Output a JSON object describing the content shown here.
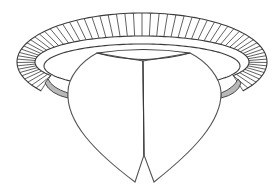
{
  "figure": {
    "width": 280,
    "height": 193,
    "colors": {
      "background": "#ffffff",
      "line": "#3a3a3a",
      "petal_line": "#555555",
      "shade": "#b8b8b8"
    },
    "collar": {
      "center_x": 142,
      "outer": {
        "cy": 62,
        "rx": 125,
        "ry": 49
      },
      "rib_band_inner": {
        "cy": 62,
        "rx": 107,
        "ry": 26
      },
      "band_inner": {
        "cy": 66,
        "rx": 98,
        "ry": 22
      },
      "rib_count": 64
    },
    "bud": {
      "top_lens": {
        "left_x": 97,
        "right_x": 190,
        "top_y": 50,
        "bottom_y": 60
      },
      "stem_line": {
        "x": 143,
        "y_top": 61,
        "y_bottom": 155
      },
      "left_tip": [
        135,
        182
      ],
      "notch_apex": [
        144,
        155
      ],
      "right_tip": [
        154,
        182
      ],
      "left_shoulder": [
        68,
        92
      ],
      "right_shoulder": [
        221,
        92
      ]
    }
  }
}
